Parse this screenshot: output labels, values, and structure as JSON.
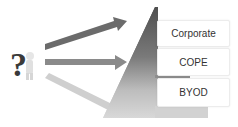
{
  "diagram": {
    "levels": [
      {
        "label": "Corporate"
      },
      {
        "label": "COPE"
      },
      {
        "label": "BYOD"
      }
    ],
    "icons": {
      "question_figure": "question-mark-person-icon"
    },
    "colors": {
      "arrow_top": "#6b6b6b",
      "arrow_mid": "#8a8a8a",
      "arrow_low": "#cfcfcf",
      "pyramid_top": "#555555",
      "pyramid_bottom": "#d4d4d4"
    }
  }
}
